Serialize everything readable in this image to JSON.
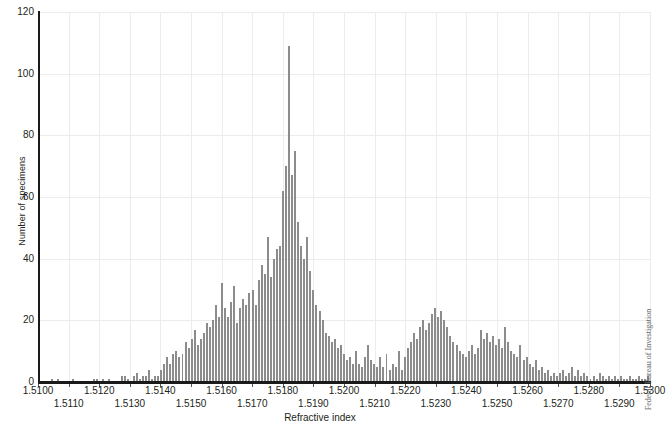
{
  "chart_data": {
    "type": "bar",
    "title": "",
    "subtitle": "",
    "xlabel": "Refractive index",
    "ylabel": "Number of specimens",
    "xlim": [
      1.51,
      1.53
    ],
    "ylim": [
      0,
      120
    ],
    "grid": true,
    "legend": null,
    "bin_width": 0.0001,
    "x_tick_labels": [
      "1.5100",
      "1.5110",
      "1.5120",
      "1.5130",
      "1.5140",
      "1.5150",
      "1.5160",
      "1.5170",
      "1.5180",
      "1.5190",
      "1.5200",
      "1.5210",
      "1.5220",
      "1.5230",
      "1.5240",
      "1.5250",
      "1.5260",
      "1.5270",
      "1.5280",
      "1.5290",
      "1.5300"
    ],
    "x_tick_values": [
      1.51,
      1.511,
      1.512,
      1.513,
      1.514,
      1.515,
      1.516,
      1.517,
      1.518,
      1.519,
      1.52,
      1.521,
      1.522,
      1.523,
      1.524,
      1.525,
      1.526,
      1.527,
      1.528,
      1.529,
      1.53
    ],
    "y_tick_labels": [
      "0",
      "20",
      "40",
      "60",
      "80",
      "100",
      "120"
    ],
    "y_tick_values": [
      0,
      20,
      40,
      60,
      80,
      100,
      120
    ],
    "bar_color": "#8c8c8c",
    "grid_color": "#ececec",
    "axis_color": "#1a1a1a",
    "annotation_credit": "Federal Bureau of Investigation",
    "x": [
      1.51,
      1.5101,
      1.5102,
      1.5103,
      1.5104,
      1.5105,
      1.5106,
      1.5107,
      1.5108,
      1.5109,
      1.511,
      1.5111,
      1.5112,
      1.5113,
      1.5114,
      1.5115,
      1.5116,
      1.5117,
      1.5118,
      1.5119,
      1.512,
      1.5121,
      1.5122,
      1.5123,
      1.5124,
      1.5125,
      1.5126,
      1.5127,
      1.5128,
      1.5129,
      1.513,
      1.5131,
      1.5132,
      1.5133,
      1.5134,
      1.5135,
      1.5136,
      1.5137,
      1.5138,
      1.5139,
      1.514,
      1.5141,
      1.5142,
      1.5143,
      1.5144,
      1.5145,
      1.5146,
      1.5147,
      1.5148,
      1.5149,
      1.515,
      1.5151,
      1.5152,
      1.5153,
      1.5154,
      1.5155,
      1.5156,
      1.5157,
      1.5158,
      1.5159,
      1.516,
      1.5161,
      1.5162,
      1.5163,
      1.5164,
      1.5165,
      1.5166,
      1.5167,
      1.5168,
      1.5169,
      1.517,
      1.5171,
      1.5172,
      1.5173,
      1.5174,
      1.5175,
      1.5176,
      1.5177,
      1.5178,
      1.5179,
      1.518,
      1.5181,
      1.5182,
      1.5183,
      1.5184,
      1.5185,
      1.5186,
      1.5187,
      1.5188,
      1.5189,
      1.519,
      1.5191,
      1.5192,
      1.5193,
      1.5194,
      1.5195,
      1.5196,
      1.5197,
      1.5198,
      1.5199,
      1.52,
      1.5201,
      1.5202,
      1.5203,
      1.5204,
      1.5205,
      1.5206,
      1.5207,
      1.5208,
      1.5209,
      1.521,
      1.5211,
      1.5212,
      1.5213,
      1.5214,
      1.5215,
      1.5216,
      1.5217,
      1.5218,
      1.5219,
      1.522,
      1.5221,
      1.5222,
      1.5223,
      1.5224,
      1.5225,
      1.5226,
      1.5227,
      1.5228,
      1.5229,
      1.523,
      1.5231,
      1.5232,
      1.5233,
      1.5234,
      1.5235,
      1.5236,
      1.5237,
      1.5238,
      1.5239,
      1.524,
      1.5241,
      1.5242,
      1.5243,
      1.5244,
      1.5245,
      1.5246,
      1.5247,
      1.5248,
      1.5249,
      1.525,
      1.5251,
      1.5252,
      1.5253,
      1.5254,
      1.5255,
      1.5256,
      1.5257,
      1.5258,
      1.5259,
      1.526,
      1.5261,
      1.5262,
      1.5263,
      1.5264,
      1.5265,
      1.5266,
      1.5267,
      1.5268,
      1.5269,
      1.527,
      1.5271,
      1.5272,
      1.5273,
      1.5274,
      1.5275,
      1.5276,
      1.5277,
      1.5278,
      1.5279,
      1.528,
      1.5281,
      1.5282,
      1.5283,
      1.5284,
      1.5285,
      1.5286,
      1.5287,
      1.5288,
      1.5289,
      1.529,
      1.5291,
      1.5292,
      1.5293,
      1.5294,
      1.5295,
      1.5296,
      1.5297,
      1.5298,
      1.5299,
      1.53
    ],
    "values": [
      0,
      0,
      0,
      0,
      1,
      0,
      1,
      0,
      0,
      0,
      0,
      1,
      0,
      0,
      0,
      0,
      0,
      0,
      1,
      1,
      0,
      1,
      0,
      1,
      0,
      0,
      0,
      2,
      2,
      1,
      0,
      2,
      3,
      1,
      2,
      2,
      4,
      1,
      2,
      2,
      4,
      6,
      8,
      6,
      9,
      10,
      8,
      9,
      13,
      11,
      14,
      17,
      12,
      14,
      16,
      19,
      18,
      20,
      25,
      21,
      32,
      24,
      21,
      26,
      31,
      19,
      24,
      27,
      25,
      29,
      30,
      25,
      33,
      38,
      35,
      47,
      34,
      40,
      43,
      44,
      62,
      70,
      109,
      67,
      75,
      52,
      44,
      40,
      47,
      36,
      30,
      25,
      23,
      20,
      16,
      15,
      13,
      14,
      11,
      12,
      9,
      7,
      8,
      6,
      10,
      6,
      5,
      8,
      12,
      7,
      6,
      5,
      8,
      5,
      9,
      4,
      6,
      5,
      10,
      4,
      8,
      11,
      13,
      16,
      14,
      18,
      20,
      17,
      19,
      22,
      24,
      21,
      23,
      20,
      18,
      15,
      13,
      12,
      10,
      9,
      8,
      10,
      12,
      9,
      11,
      17,
      14,
      16,
      13,
      15,
      12,
      14,
      11,
      18,
      13,
      10,
      9,
      8,
      12,
      7,
      8,
      6,
      5,
      7,
      4,
      5,
      3,
      4,
      2,
      3,
      2,
      3,
      4,
      2,
      3,
      5,
      2,
      4,
      2,
      3,
      2,
      1,
      2,
      1,
      3,
      2,
      1,
      2,
      1,
      2,
      1,
      2,
      1,
      1,
      2,
      1,
      1,
      2,
      1,
      1,
      2
    ]
  }
}
